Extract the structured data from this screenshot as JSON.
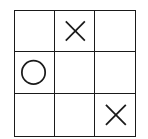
{
  "game": {
    "title": "Tic-tac-toe",
    "board": [
      [
        "",
        "X",
        ""
      ],
      [
        "O",
        "",
        ""
      ],
      [
        "",
        "",
        "X"
      ]
    ],
    "line_color": "#1a1a1a",
    "mark_color": "#1a1a1a"
  }
}
